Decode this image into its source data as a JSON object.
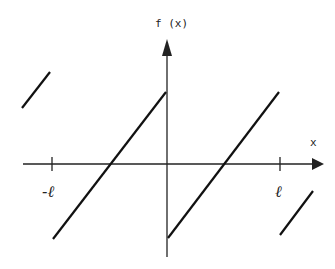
{
  "diagram": {
    "y_axis_label": "f (x)",
    "x_axis_label": "x",
    "ticks": [
      {
        "label": "-ℓ",
        "position": "-l"
      },
      {
        "label": "ℓ",
        "position": "l"
      }
    ],
    "colors": {
      "line": "#111111",
      "axis": "#222222",
      "background": "#ffffff"
    }
  }
}
